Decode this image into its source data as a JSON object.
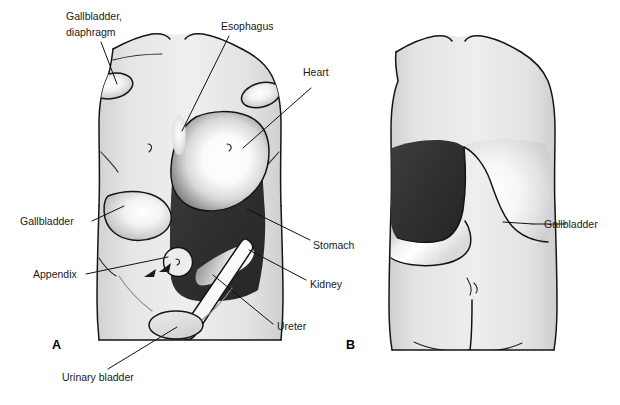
{
  "figure": {
    "panels": [
      {
        "id": "A",
        "label": "A",
        "view": "anterior"
      },
      {
        "id": "B",
        "label": "B",
        "view": "posterior"
      }
    ],
    "colors": {
      "body_fill_light": "#ececec",
      "body_fill_mid": "#dcdcdc",
      "body_fill_shadow": "#c9c9c9",
      "organ_dark": "#313131",
      "organ_highlight": "#ffffff",
      "outline": "#151515",
      "label_text": "#1a1a1a",
      "leader_line": "#111111",
      "background": "#ffffff"
    }
  },
  "panel_a": {
    "label": "A",
    "labels": [
      {
        "name": "gallbladder-diaphragm",
        "line1": "Gallbladder,",
        "line2": "diaphragm"
      },
      {
        "name": "esophagus",
        "text": "Esophagus"
      },
      {
        "name": "heart",
        "text": "Heart"
      },
      {
        "name": "gallbladder",
        "text": "Gallbladder"
      },
      {
        "name": "appendix",
        "text": "Appendix"
      },
      {
        "name": "urinary-bladder",
        "text": "Urinary bladder"
      },
      {
        "name": "stomach",
        "text": "Stomach"
      },
      {
        "name": "kidney",
        "text": "Kidney"
      },
      {
        "name": "ureter",
        "text": "Ureter"
      }
    ]
  },
  "panel_b": {
    "label": "B",
    "labels": [
      {
        "name": "gallbladder",
        "text": "Gallbladder"
      },
      {
        "name": "stomach",
        "text": "Stomach"
      },
      {
        "name": "kidney",
        "text": "Kidney"
      }
    ]
  },
  "text": {
    "gallbladder_diaphragm_l1": "Gallbladder,",
    "gallbladder_diaphragm_l2": "diaphragm",
    "esophagus": "Esophagus",
    "heart": "Heart",
    "gallbladder_a": "Gallbladder",
    "appendix": "Appendix",
    "urinary_bladder": "Urinary bladder",
    "stomach": "Stomach",
    "kidney": "Kidney",
    "ureter": "Ureter",
    "gallbladder_b": "Gallbladder",
    "panel_a": "A",
    "panel_b": "B"
  }
}
